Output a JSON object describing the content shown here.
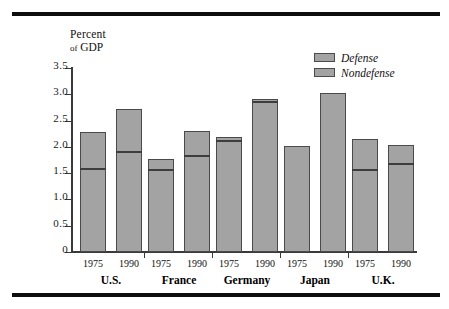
{
  "figure": {
    "axis_title_line1": "Percent",
    "axis_title_line2_prefix": "of",
    "axis_title_line2_main": "GDP"
  },
  "legend": {
    "items": [
      {
        "label": "Defense",
        "color": "#a3a3a3"
      },
      {
        "label": "Nondefense",
        "color": "#a3a3a3"
      }
    ]
  },
  "chart_data": {
    "type": "bar",
    "title": "",
    "subtitle": "",
    "xlabel": "",
    "ylabel": "Percent of GDP",
    "ylim": [
      0,
      3.5
    ],
    "yticks": [
      "0",
      "0.5",
      "1.0",
      "1.5",
      "2.0",
      "2.5",
      "3.0",
      "3.5"
    ],
    "ytick_values": [
      0,
      0.5,
      1.0,
      1.5,
      2.0,
      2.5,
      3.0,
      3.5
    ],
    "grid": false,
    "legend_position": "top-right",
    "stacked": true,
    "series": [
      {
        "name": "Nondefense",
        "note": "lower segment of each stacked bar"
      },
      {
        "name": "Defense",
        "note": "upper segment of each stacked bar"
      }
    ],
    "groups": [
      {
        "name": "U.S.",
        "bars": [
          {
            "year": "1975",
            "total": 2.28,
            "nondefense": 1.55,
            "defense": 0.73
          },
          {
            "year": "1990",
            "total": 2.72,
            "nondefense": 1.86,
            "defense": 0.86
          }
        ]
      },
      {
        "name": "France",
        "bars": [
          {
            "year": "1975",
            "total": 1.77,
            "nondefense": 1.52,
            "defense": 0.25
          },
          {
            "year": "1990",
            "total": 2.31,
            "nondefense": 1.78,
            "defense": 0.53
          }
        ]
      },
      {
        "name": "Germany",
        "bars": [
          {
            "year": "1975",
            "total": 2.18,
            "nondefense": 2.07,
            "defense": 0.11
          },
          {
            "year": "1990",
            "total": 2.91,
            "nondefense": 2.82,
            "defense": 0.09
          }
        ]
      },
      {
        "name": "Japan",
        "bars": [
          {
            "year": "1975",
            "total": 2.02,
            "nondefense": 2.02,
            "defense": 0.0
          },
          {
            "year": "1990",
            "total": 3.02,
            "nondefense": 3.02,
            "defense": 0.0
          }
        ]
      },
      {
        "name": "U.K.",
        "bars": [
          {
            "year": "1975",
            "total": 2.15,
            "nondefense": 1.53,
            "defense": 0.62
          },
          {
            "year": "1990",
            "total": 2.04,
            "nondefense": 1.63,
            "defense": 0.41
          }
        ]
      }
    ]
  }
}
